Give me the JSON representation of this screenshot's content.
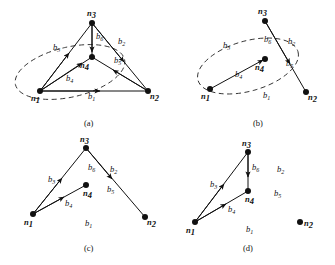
{
  "figure": {
    "caption_a": "(a)",
    "caption_b": "(b)",
    "caption_c": "(c)",
    "caption_d": "(d)",
    "colors": {
      "ink": "#111111",
      "background": "#ffffff",
      "dashed": "#333333"
    }
  },
  "nodes": {
    "n1": "n",
    "n1_sub": "1",
    "n2": "n",
    "n2_sub": "2",
    "n3": "n",
    "n3_sub": "3",
    "n4": "n",
    "n4_sub": "4"
  },
  "branches": {
    "b1": "b",
    "b1_sub": "1",
    "b2": "b",
    "b2_sub": "2",
    "b3": "b",
    "b3_sub": "3",
    "b4": "b",
    "b4_sub": "4",
    "b5": "b",
    "b5_sub": "5",
    "b6": "b",
    "b6_sub": "6"
  },
  "panels": {
    "a": {
      "caption": "(a)",
      "node_labels": [
        "n1",
        "n2",
        "n3",
        "n4"
      ],
      "branch_labels": [
        "b1",
        "b2",
        "b3",
        "b4",
        "b5",
        "b6"
      ],
      "edges": [
        {
          "branch": "b1",
          "from": "n1",
          "to": "n2"
        },
        {
          "branch": "b2",
          "from": "n3",
          "to": "n2"
        },
        {
          "branch": "b3",
          "from": "n1",
          "to": "n3"
        },
        {
          "branch": "b4",
          "from": "n1",
          "to": "n4"
        },
        {
          "branch": "b5",
          "from": "n2",
          "to": "n4"
        },
        {
          "branch": "b6",
          "from": "n3",
          "to": "n4"
        }
      ],
      "cutset_ellipse": true,
      "cutset_members": [
        "n1",
        "n4"
      ]
    },
    "b": {
      "caption": "(b)",
      "node_labels": [
        "n1",
        "n2",
        "n3",
        "n4"
      ],
      "branch_labels": [
        "b1",
        "b2",
        "b3",
        "b4",
        "b5",
        "b6"
      ],
      "edges": [
        {
          "branch": "b4",
          "from": "n1",
          "to": "n4"
        },
        {
          "branch": "b2",
          "from": "n3",
          "to": "n2"
        }
      ],
      "cutset_ellipse": true,
      "cutset_members": [
        "n1",
        "n4"
      ]
    },
    "c": {
      "caption": "(c)",
      "node_labels": [
        "n1",
        "n2",
        "n3",
        "n4"
      ],
      "branch_labels": [
        "b1",
        "b2",
        "b3",
        "b4",
        "b5",
        "b6"
      ],
      "edges": [
        {
          "branch": "b3",
          "from": "n1",
          "to": "n3"
        },
        {
          "branch": "b4",
          "from": "n1",
          "to": "n4"
        },
        {
          "branch": "b6",
          "from": "n3",
          "to": "n4"
        },
        {
          "branch": "b2",
          "from": "n3",
          "to": "n2"
        }
      ],
      "cutset_ellipse": false
    },
    "d": {
      "caption": "(d)",
      "node_labels": [
        "n1",
        "n2",
        "n3",
        "n4"
      ],
      "branch_labels": [
        "b1",
        "b2",
        "b3",
        "b4",
        "b5",
        "b6"
      ],
      "edges": [
        {
          "branch": "b3",
          "from": "n1",
          "to": "n3"
        },
        {
          "branch": "b4",
          "from": "n1",
          "to": "n4"
        },
        {
          "branch": "b6",
          "from": "n3",
          "to": "n4"
        }
      ],
      "cutset_ellipse": false
    }
  }
}
